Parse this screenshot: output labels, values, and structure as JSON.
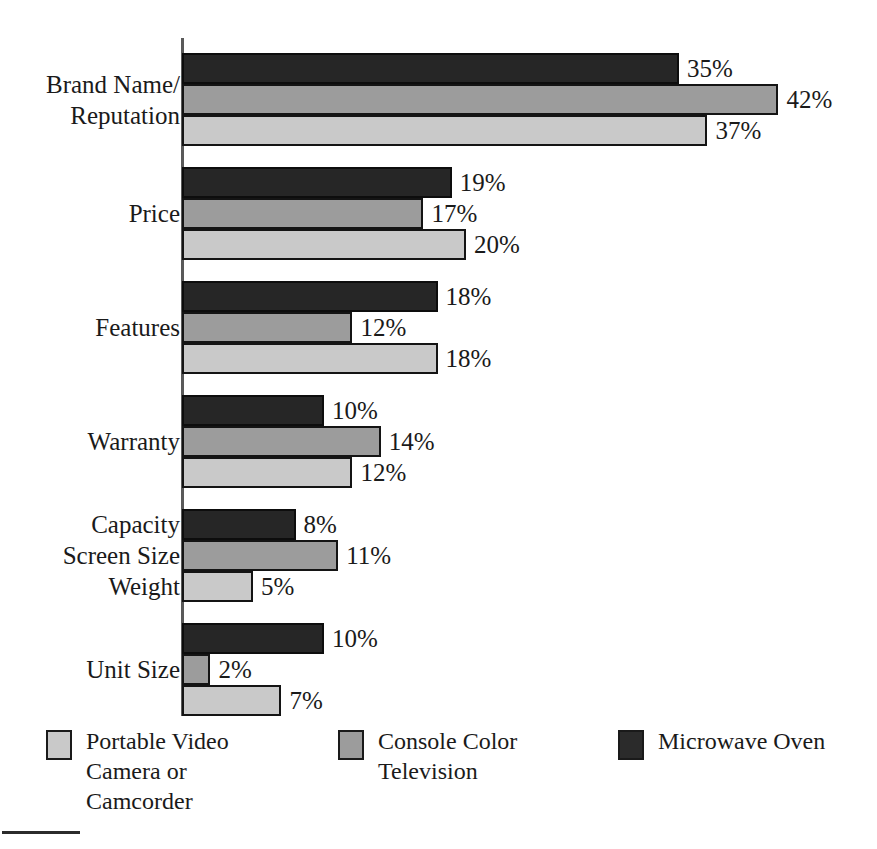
{
  "chart_data": {
    "type": "bar",
    "orientation": "horizontal",
    "title": "",
    "subtitle": "",
    "xlabel": "",
    "ylabel": "",
    "xlim": [
      0,
      42
    ],
    "grid": false,
    "value_suffix": "%",
    "legend_position": "bottom",
    "categories": [
      "Brand Name/\nReputation",
      "Price",
      "Features",
      "Warranty",
      "Capacity / Screen Size / Weight",
      "Unit Size"
    ],
    "series": [
      {
        "name": "Microwave Oven",
        "color": "#262626",
        "values": [
          35,
          19,
          18,
          10,
          8,
          10
        ],
        "labels": [
          "35%",
          "19%",
          "18%",
          "10%",
          "8%",
          "10%"
        ]
      },
      {
        "name": "Console Color Television",
        "color": "#9c9c9c",
        "values": [
          42,
          17,
          12,
          14,
          11,
          2
        ],
        "labels": [
          "42%",
          "17%",
          "12%",
          "14%",
          "11%",
          "2%"
        ]
      },
      {
        "name": "Portable Video Camera or Camcorder",
        "color": "#c9c9c9",
        "values": [
          37,
          20,
          18,
          12,
          5,
          7
        ],
        "labels": [
          "37%",
          "20%",
          "18%",
          "12%",
          "5%",
          "7%"
        ]
      }
    ]
  },
  "axis": {
    "line_color": "#5a5a5a"
  },
  "groups": [
    {
      "label_mode": "single",
      "label": "Brand Name/\nReputation",
      "bars": [
        {
          "series": "microwave",
          "value": 35,
          "label": "35%"
        },
        {
          "series": "television",
          "value": 42,
          "label": "42%"
        },
        {
          "series": "camcorder",
          "value": 37,
          "label": "37%"
        }
      ]
    },
    {
      "label_mode": "single",
      "label": "Price",
      "bars": [
        {
          "series": "microwave",
          "value": 19,
          "label": "19%"
        },
        {
          "series": "television",
          "value": 17,
          "label": "17%"
        },
        {
          "series": "camcorder",
          "value": 20,
          "label": "20%"
        }
      ]
    },
    {
      "label_mode": "single",
      "label": "Features",
      "bars": [
        {
          "series": "microwave",
          "value": 18,
          "label": "18%"
        },
        {
          "series": "television",
          "value": 12,
          "label": "12%"
        },
        {
          "series": "camcorder",
          "value": 18,
          "label": "18%"
        }
      ]
    },
    {
      "label_mode": "single",
      "label": "Warranty",
      "bars": [
        {
          "series": "microwave",
          "value": 10,
          "label": "10%"
        },
        {
          "series": "television",
          "value": 14,
          "label": "14%"
        },
        {
          "series": "camcorder",
          "value": 12,
          "label": "12%"
        }
      ]
    },
    {
      "label_mode": "per-bar",
      "label": "",
      "bar_labels": [
        "Capacity",
        "Screen Size",
        "Weight"
      ],
      "bars": [
        {
          "series": "microwave",
          "value": 8,
          "label": "8%"
        },
        {
          "series": "television",
          "value": 11,
          "label": "11%"
        },
        {
          "series": "camcorder",
          "value": 5,
          "label": "5%"
        }
      ]
    },
    {
      "label_mode": "single",
      "label": "Unit Size",
      "bars": [
        {
          "series": "microwave",
          "value": 10,
          "label": "10%"
        },
        {
          "series": "television",
          "value": 2,
          "label": "2%"
        },
        {
          "series": "camcorder",
          "value": 7,
          "label": "7%"
        }
      ]
    }
  ],
  "legend": {
    "items": [
      {
        "key": "camcorder",
        "label": "Portable Video\nCamera or\nCamcorder"
      },
      {
        "key": "television",
        "label": "Console Color\nTelevision"
      },
      {
        "key": "microwave",
        "label": "Microwave Oven"
      }
    ]
  }
}
